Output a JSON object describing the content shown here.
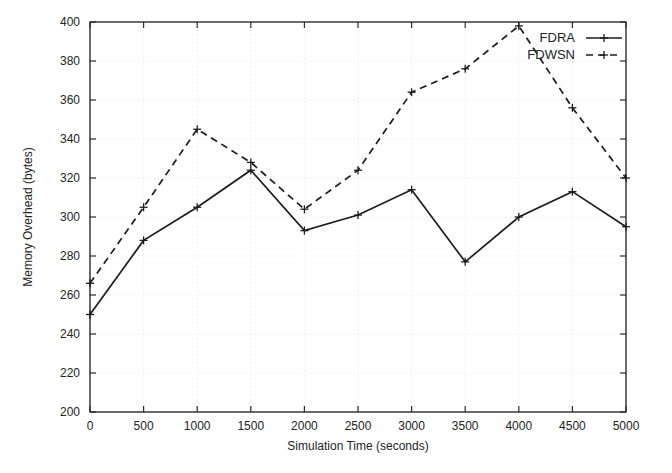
{
  "chart_data": {
    "type": "line",
    "title": "",
    "xlabel": "Simulation Time (seconds)",
    "ylabel": "Memory Overhead (bytes)",
    "xlim": [
      0,
      5000
    ],
    "ylim": [
      200,
      400
    ],
    "xticks": [
      0,
      500,
      1000,
      1500,
      2000,
      2500,
      3000,
      3500,
      4000,
      4500,
      5000
    ],
    "yticks": [
      200,
      220,
      240,
      260,
      280,
      300,
      320,
      340,
      360,
      380,
      400
    ],
    "xtick_labels": [
      "0",
      "500",
      "1000",
      "1500",
      "2000",
      "2500",
      "3000",
      "3500",
      "4000",
      "4500",
      "5000"
    ],
    "ytick_labels": [
      "200",
      "220",
      "240",
      "260",
      "280",
      "300",
      "320",
      "340",
      "360",
      "380",
      "400"
    ],
    "grid": true,
    "legend_position": "top-right",
    "x": [
      0,
      500,
      1000,
      1500,
      2000,
      2500,
      3000,
      3500,
      4000,
      4500,
      5000
    ],
    "series": [
      {
        "name": "FDRA",
        "style": "solid",
        "marker": "plus",
        "color": "#1c1c1c",
        "values": [
          250,
          288,
          305,
          324,
          293,
          301,
          314,
          277,
          300,
          313,
          295
        ]
      },
      {
        "name": "FDWSN",
        "style": "dashed",
        "marker": "plus",
        "color": "#1c1c1c",
        "values": [
          266,
          305,
          345,
          328,
          304,
          324,
          364,
          376,
          398,
          356,
          320
        ]
      }
    ]
  },
  "legend": {
    "entries": [
      {
        "label": "FDRA"
      },
      {
        "label": "FDWSN"
      }
    ]
  },
  "axes": {
    "x_title": "Simulation Time (seconds)",
    "y_title": "Memory Overhead (bytes)"
  }
}
